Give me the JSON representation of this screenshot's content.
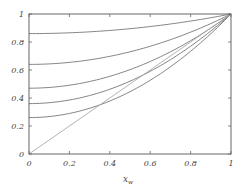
{
  "chart_data": {
    "type": "line",
    "title": "",
    "xlabel": "x_w",
    "xlabel_main": "x",
    "xlabel_sub": "w",
    "ylabel": "",
    "xlim": [
      0,
      1
    ],
    "ylim": [
      0,
      1
    ],
    "grid": false,
    "x_ticks": [
      "0",
      "0.2",
      "0.4",
      "0.6",
      "0.8",
      "1"
    ],
    "y_ticks": [
      "0",
      "0.2",
      "0.4",
      "0.6",
      "0.8",
      "1"
    ],
    "x": [
      0,
      0.1,
      0.2,
      0.3,
      0.4,
      0.5,
      0.6,
      0.7,
      0.8,
      0.9,
      1.0
    ],
    "series": [
      {
        "name": "curve-1",
        "intercept": 0.86,
        "values": [
          0.86,
          0.861,
          0.866,
          0.873,
          0.882,
          0.895,
          0.91,
          0.929,
          0.95,
          0.973,
          1.0
        ]
      },
      {
        "name": "curve-2",
        "intercept": 0.64,
        "values": [
          0.64,
          0.644,
          0.654,
          0.672,
          0.698,
          0.73,
          0.77,
          0.816,
          0.87,
          0.932,
          1.0
        ]
      },
      {
        "name": "curve-3",
        "intercept": 0.47,
        "values": [
          0.47,
          0.475,
          0.491,
          0.518,
          0.555,
          0.603,
          0.661,
          0.73,
          0.809,
          0.899,
          1.0
        ]
      },
      {
        "name": "curve-4",
        "intercept": 0.36,
        "values": [
          0.36,
          0.366,
          0.386,
          0.418,
          0.462,
          0.52,
          0.59,
          0.674,
          0.77,
          0.878,
          1.0
        ]
      },
      {
        "name": "curve-5",
        "intercept": 0.26,
        "values": [
          0.26,
          0.267,
          0.29,
          0.327,
          0.378,
          0.445,
          0.526,
          0.623,
          0.734,
          0.859,
          1.0
        ]
      },
      {
        "name": "diagonal",
        "intercept": 0.0,
        "values": [
          0,
          0.1,
          0.2,
          0.3,
          0.4,
          0.5,
          0.6,
          0.7,
          0.8,
          0.9,
          1.0
        ]
      }
    ],
    "colors": {
      "axis": "#666666",
      "curve": "#777777",
      "diagonal": "#aaaaaa"
    }
  }
}
